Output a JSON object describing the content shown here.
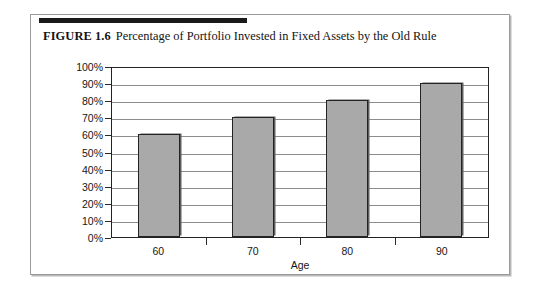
{
  "figure": {
    "label": "FIGURE 1.6",
    "caption": "Percentage of Portfolio Invested in Fixed Assets by the Old Rule"
  },
  "chart_data": {
    "type": "bar",
    "title": "Percentage of Portfolio Invested in Fixed Assets by the Old Rule",
    "categories": [
      "60",
      "70",
      "80",
      "90"
    ],
    "values": [
      60,
      70,
      80,
      90
    ],
    "series": [
      {
        "name": "Percentage of Portfolio Invested in Fixed Assets",
        "values": [
          60,
          70,
          80,
          90
        ]
      }
    ],
    "xlabel": "Age",
    "ylabel": "",
    "ylim": [
      0,
      100
    ],
    "ytick_values": [
      100,
      90,
      80,
      70,
      60,
      50,
      40,
      30,
      20,
      10,
      0
    ],
    "ytick_labels": [
      "100%",
      "90%",
      "80%",
      "70%",
      "60%",
      "50%",
      "40%",
      "30%",
      "20%",
      "10%",
      "0%"
    ],
    "grid": true,
    "legend": false,
    "bar_color": "#a9a9a9",
    "bar_edge_color": "#232323",
    "axis_color": "#232323",
    "gridline_color": "#8d8d8d"
  }
}
